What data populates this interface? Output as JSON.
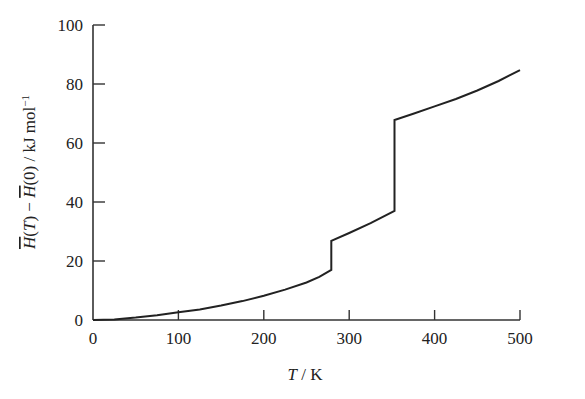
{
  "chart_data": {
    "type": "line",
    "title": "",
    "xlabel": "T / K",
    "ylabel": "H̄(T) − H̄(0) / kJ mol⁻¹",
    "xlim": [
      0,
      500
    ],
    "ylim": [
      0,
      100
    ],
    "xticks": [
      0,
      100,
      200,
      300,
      400,
      500
    ],
    "yticks": [
      0,
      20,
      40,
      60,
      80,
      100
    ],
    "grid": false,
    "legend": null,
    "series": [
      {
        "name": "enthalpy",
        "color": "#222222",
        "points": [
          [
            0,
            0
          ],
          [
            25,
            0.2
          ],
          [
            50,
            0.8
          ],
          [
            75,
            1.6
          ],
          [
            100,
            2.6
          ],
          [
            125,
            3.6
          ],
          [
            150,
            4.9
          ],
          [
            175,
            6.4
          ],
          [
            200,
            8.2
          ],
          [
            225,
            10.3
          ],
          [
            250,
            12.7
          ],
          [
            265,
            14.6
          ],
          [
            279,
            17.0
          ],
          [
            279,
            26.8
          ],
          [
            300,
            29.5
          ],
          [
            325,
            32.8
          ],
          [
            353,
            37.0
          ],
          [
            353,
            67.8
          ],
          [
            375,
            69.9
          ],
          [
            400,
            72.4
          ],
          [
            425,
            74.9
          ],
          [
            450,
            77.8
          ],
          [
            475,
            81.0
          ],
          [
            500,
            84.7
          ]
        ]
      }
    ],
    "annotations": [
      {
        "type": "step",
        "T": 279,
        "from": 17.0,
        "to": 26.8
      },
      {
        "type": "step",
        "T": 353,
        "from": 37.0,
        "to": 67.8
      }
    ]
  },
  "labels": {
    "x_axis": "T / K",
    "y_axis_H": "H",
    "y_axis_rest": "(T) − ",
    "y_axis_H2": "H",
    "y_axis_tail": "(0) / kJ mol",
    "y_axis_sup": "−1"
  }
}
